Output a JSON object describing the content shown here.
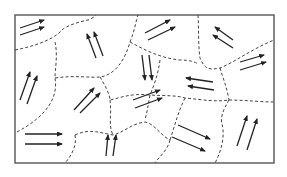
{
  "diagram": {
    "title": "",
    "frame": {
      "x": 15,
      "y": 15,
      "w": 259,
      "h": 148,
      "color": "#555555"
    },
    "wall_color": "#444444",
    "arrow_color": "#222222",
    "walls": [
      "M15,50 C40,45 55,38 62,30 C66,26 78,22 88,20 C92,19 95,16 96,15",
      "M55,42 C58,55 55,70 55,78 C58,95 50,115 15,133",
      "M55,78 C75,75 90,78 100,77 C115,75 125,60 130,42 C135,30 136,20 138,15",
      "M130,42 C145,50 160,58 180,60 C190,60 195,62 198,64",
      "M198,15 C199,30 198,45 200,58 C205,70 210,70 220,68 C235,62 250,50 274,40",
      "M220,68 C223,78 227,88 229,100",
      "M160,60 C158,75 154,85 150,95",
      "M100,77 C105,85 110,95 110,100 C120,98 130,93 150,95 C165,96 175,95 185,98 C205,100 215,102 229,100",
      "M229,100 C245,100 260,102 274,102",
      "M110,100 C112,115 108,125 113,135",
      "M75,135 C90,128 100,133 113,135 C125,132 130,124 145,122 C155,124 160,135 170,140",
      "M75,135 C77,145 72,155 65,163",
      "M170,140 C168,150 158,158 155,163",
      "M150,95 C148,105 148,108 145,120",
      "M229,100 C223,110 220,118 222,124 C225,135 222,150 215,163",
      "M185,98 C178,112 175,125 170,140"
    ],
    "domains": [
      {
        "id": "d1",
        "arrows": [
          [
            20,
            28,
            44,
            20
          ],
          [
            20,
            35,
            44,
            27
          ]
        ]
      },
      {
        "id": "d2",
        "arrows": [
          [
            96,
            58,
            87,
            34
          ],
          [
            103,
            56,
            94,
            32
          ]
        ]
      },
      {
        "id": "d3",
        "arrows": [
          [
            145,
            33,
            170,
            20
          ],
          [
            148,
            40,
            175,
            27
          ]
        ]
      },
      {
        "id": "d4",
        "arrows": [
          [
            233,
            40,
            215,
            27
          ],
          [
            233,
            48,
            213,
            35
          ]
        ]
      },
      {
        "id": "d5",
        "arrows": [
          [
            240,
            62,
            264,
            55
          ],
          [
            240,
            70,
            266,
            62
          ]
        ]
      },
      {
        "id": "d6",
        "arrows": [
          [
            20,
            100,
            30,
            72
          ],
          [
            27,
            104,
            37,
            76
          ]
        ]
      },
      {
        "id": "d7",
        "arrows": [
          [
            142,
            55,
            145,
            80
          ],
          [
            149,
            55,
            152,
            80
          ]
        ]
      },
      {
        "id": "d8",
        "arrows": [
          [
            213,
            82,
            186,
            78
          ],
          [
            214,
            90,
            188,
            86
          ]
        ]
      },
      {
        "id": "d9",
        "arrows": [
          [
            74,
            110,
            94,
            88
          ],
          [
            80,
            113,
            100,
            93
          ]
        ]
      },
      {
        "id": "d10",
        "arrows": [
          [
            133,
            100,
            160,
            90
          ],
          [
            135,
            108,
            162,
            98
          ]
        ]
      },
      {
        "id": "d11",
        "arrows": [
          [
            25,
            134,
            62,
            134
          ],
          [
            25,
            144,
            62,
            144
          ]
        ]
      },
      {
        "id": "d12",
        "arrows": [
          [
            106,
            156,
            108,
            135
          ],
          [
            113,
            156,
            116,
            135
          ]
        ]
      },
      {
        "id": "d13",
        "arrows": [
          [
            178,
            125,
            210,
            139
          ],
          [
            172,
            137,
            205,
            151
          ]
        ]
      },
      {
        "id": "d14",
        "arrows": [
          [
            237,
            146,
            247,
            116
          ],
          [
            247,
            150,
            257,
            119
          ]
        ]
      }
    ]
  }
}
